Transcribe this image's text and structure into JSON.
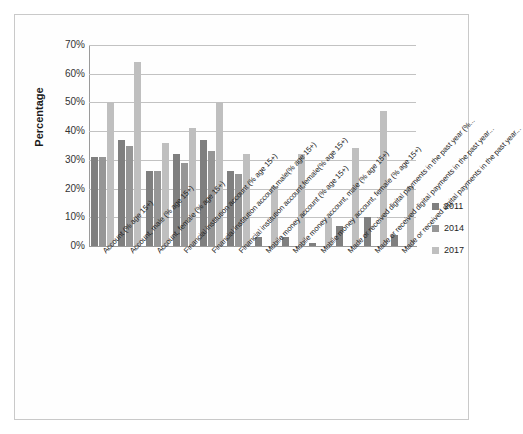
{
  "chart_data": {
    "type": "bar",
    "title": "",
    "xlabel": "",
    "ylabel": "Percentage",
    "ylim": [
      0,
      70
    ],
    "ytick_labels": [
      "70%",
      "60%",
      "50%",
      "40%",
      "30%",
      "20%",
      "10%",
      "0%"
    ],
    "ytick_values": [
      70,
      60,
      50,
      40,
      30,
      20,
      10,
      0
    ],
    "grid": true,
    "legend_position": "right",
    "categories": [
      "Account (% age 15+)",
      "Account, male (% age 15+)",
      "Account, female (% age 15+)",
      "Financial institution account (% age 15+)",
      "Financial institution account,male(% age 15+)",
      "Financial institution account,female(% age 15+)",
      "Mobile money account (% age 15+)",
      "Mobile money account, male  (% age 15+)",
      "Mobile money account, female (% age 15+)",
      "Made or received digital payments in the past year (%...",
      "Made or received digital payments in the past year...",
      "Made or received digital payments in the past year..."
    ],
    "series": [
      {
        "name": "2011",
        "color": "#7f7f7f",
        "values": [
          31,
          37,
          26,
          32,
          37,
          26,
          3,
          3,
          1,
          7,
          10,
          4
        ]
      },
      {
        "name": "2014",
        "color": "#969696",
        "values": [
          31,
          35,
          26,
          29,
          33,
          25,
          0,
          0,
          0,
          0,
          0,
          0
        ]
      },
      {
        "name": "2017",
        "color": "#bfbfbf",
        "values": [
          50,
          64,
          36,
          41,
          50,
          32,
          21,
          32,
          10,
          34,
          47,
          21
        ]
      }
    ]
  },
  "legend": {
    "entries": [
      {
        "label": "2011"
      },
      {
        "label": "2014"
      },
      {
        "label": "2017"
      }
    ]
  }
}
